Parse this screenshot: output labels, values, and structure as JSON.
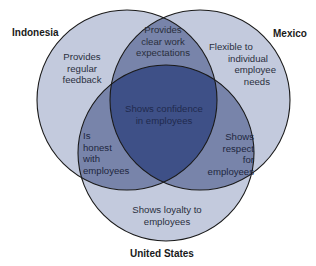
{
  "diagram": {
    "type": "venn",
    "colors": {
      "single": "#c3cadd",
      "double": "#7884aa",
      "triple": "#3e5087",
      "outline": "#1a1a1a"
    },
    "sets": {
      "indonesia": {
        "label": "Indonesia"
      },
      "mexico": {
        "label": "Mexico"
      },
      "united_states": {
        "label": "United States"
      }
    },
    "regions": {
      "indonesia_only": [
        "Provides",
        "regular",
        "feedback"
      ],
      "indonesia_mexico": [
        "Provides",
        "clear work",
        "expectations"
      ],
      "mexico_only": [
        "Flexible to",
        "individual",
        "employee",
        "needs"
      ],
      "all_three": [
        "Shows confidence",
        "in employees"
      ],
      "indonesia_us": [
        "Is",
        "honest",
        "with",
        "employees"
      ],
      "mexico_us": [
        "Shows",
        "respect",
        "for",
        "employees"
      ],
      "us_only": [
        "Shows loyalty to",
        "employees"
      ]
    }
  }
}
